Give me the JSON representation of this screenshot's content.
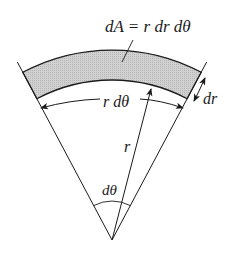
{
  "diagram": {
    "labels": {
      "area_formula": "dA = r dr dθ",
      "arc_length": "r dθ",
      "radial_width": "dr",
      "radius": "r",
      "angle": "dθ"
    },
    "colors": {
      "stroke": "#1a1a1a",
      "shaded_region": "#c8c8c8"
    }
  }
}
